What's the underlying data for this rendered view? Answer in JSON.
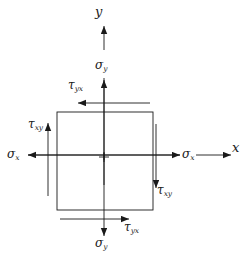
{
  "figure": {
    "type": "stress-element-diagram",
    "stroke_color": "#1a1a1a",
    "background_color": "#ffffff"
  },
  "axes": {
    "y": {
      "symbol": "y",
      "direction": "up",
      "x": 104,
      "label_x": 95,
      "label_y": 5
    },
    "x": {
      "symbol": "x",
      "direction": "right",
      "y": 155,
      "label_x": 232,
      "label_y": 141
    }
  },
  "element": {
    "shape": "square",
    "left": 57,
    "top": 112,
    "right": 153,
    "bottom": 210,
    "center_mark": "+",
    "center_x": 104,
    "center_y": 157
  },
  "stresses": [
    {
      "id": "sigma-y-top",
      "symbol": "σ",
      "subscript": "y",
      "kind": "normal",
      "direction": "up",
      "label_x": 95,
      "label_y": 59
    },
    {
      "id": "sigma-y-bottom",
      "symbol": "σ",
      "subscript": "y",
      "kind": "normal",
      "direction": "down",
      "label_x": 95,
      "label_y": 237
    },
    {
      "id": "sigma-x-left",
      "symbol": "σ",
      "subscript": "x",
      "kind": "normal",
      "direction": "left",
      "label_x": 7,
      "label_y": 148
    },
    {
      "id": "sigma-x-right",
      "symbol": "σ",
      "subscript": "x",
      "kind": "normal",
      "direction": "right",
      "label_x": 182,
      "label_y": 148
    },
    {
      "id": "tau-yx-top",
      "symbol": "τ",
      "subscript": "yx",
      "kind": "shear",
      "direction": "left",
      "label_x": 68,
      "label_y": 79
    },
    {
      "id": "tau-yx-bottom",
      "symbol": "τ",
      "subscript": "yx",
      "kind": "shear",
      "direction": "right",
      "label_x": 124,
      "label_y": 221
    },
    {
      "id": "tau-xy-left",
      "symbol": "τ",
      "subscript": "xy",
      "kind": "shear",
      "direction": "up",
      "label_x": 28,
      "label_y": 118
    },
    {
      "id": "tau-xy-right",
      "symbol": "τ",
      "subscript": "xy",
      "kind": "shear",
      "direction": "down",
      "label_x": 157,
      "label_y": 184
    }
  ]
}
